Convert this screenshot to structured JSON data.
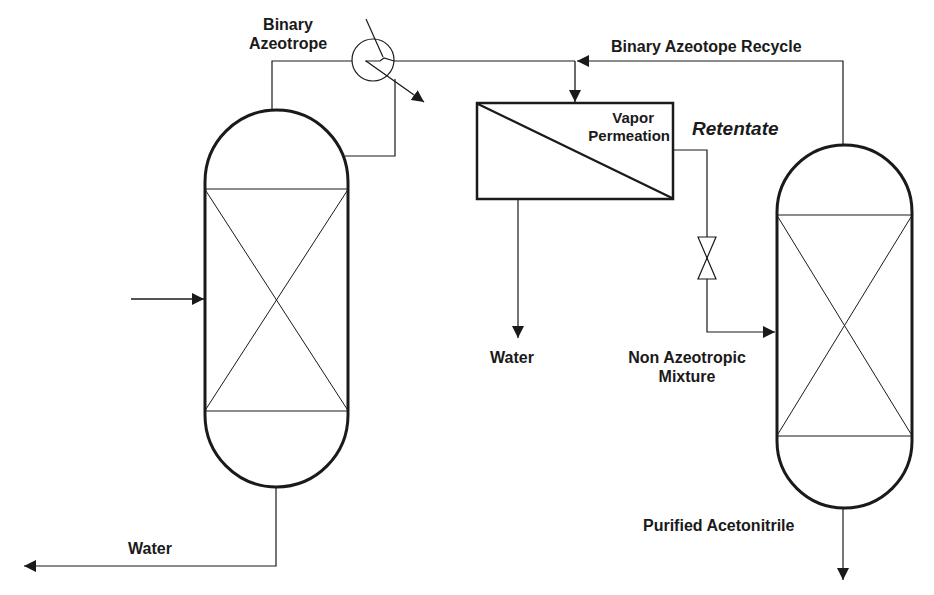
{
  "diagram": {
    "type": "process-flow-diagram",
    "colors": {
      "line": "#1a1a1a",
      "background": "#ffffff"
    },
    "labels": {
      "binary_azeotrope_line1": "Binary",
      "binary_azeotrope_line2": "Azeotrope",
      "recycle": "Binary Azeotope Recycle",
      "vapor_permeation_line1": "Vapor",
      "vapor_permeation_line2": "Permeation",
      "retentate": "Retentate",
      "water_permeate": "Water",
      "non_azeotropic_line1": "Non Azeotropic",
      "non_azeotropic_line2": "Mixture",
      "water_bottoms": "Water",
      "purified_acetonitrile": "Purified Acetonitrile"
    },
    "units": [
      {
        "id": "column-1",
        "kind": "packed-distillation-column"
      },
      {
        "id": "condenser",
        "kind": "heat-exchanger"
      },
      {
        "id": "vapor-permeation",
        "kind": "membrane-unit"
      },
      {
        "id": "valve",
        "kind": "control-valve"
      },
      {
        "id": "column-2",
        "kind": "packed-distillation-column"
      }
    ],
    "streams": [
      {
        "from": "feed",
        "to": "column-1"
      },
      {
        "from": "column-1",
        "to": "condenser",
        "label": "Binary Azeotrope"
      },
      {
        "from": "condenser",
        "to": "column-1",
        "label": "reflux"
      },
      {
        "from": "condenser",
        "to": "vapor-permeation"
      },
      {
        "from": "column-2",
        "to": "vapor-permeation",
        "label": "Binary Azeotope Recycle"
      },
      {
        "from": "vapor-permeation",
        "to": "out",
        "label": "Water"
      },
      {
        "from": "vapor-permeation",
        "to": "valve",
        "label": "Retentate"
      },
      {
        "from": "valve",
        "to": "column-2",
        "label": "Non Azeotropic Mixture"
      },
      {
        "from": "column-1",
        "to": "out",
        "label": "Water"
      },
      {
        "from": "column-2",
        "to": "out",
        "label": "Purified Acetonitrile"
      }
    ]
  }
}
